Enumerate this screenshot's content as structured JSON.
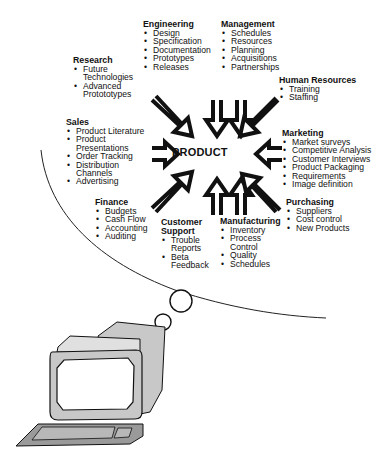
{
  "diagram": {
    "center_label": "PRODUCT",
    "groups": [
      {
        "id": "engineering",
        "title": "Engineering",
        "items": [
          "Design",
          "Specification",
          "Documentation",
          "Prototypes",
          "Releases"
        ]
      },
      {
        "id": "management",
        "title": "Management",
        "items": [
          "Schedules",
          "Resources",
          "Planning",
          "Acquisitions",
          "Partnerships"
        ]
      },
      {
        "id": "research",
        "title": "Research",
        "items": [
          "Future Technologies",
          "Advanced Protototypes"
        ]
      },
      {
        "id": "human-resources",
        "title": "Human Resources",
        "items": [
          "Training",
          "Staffing"
        ]
      },
      {
        "id": "sales",
        "title": "Sales",
        "items": [
          "Product Literature",
          "Product Presentations",
          "Order Tracking",
          "Distribution Channels",
          "Advertising"
        ]
      },
      {
        "id": "marketing",
        "title": "Marketing",
        "items": [
          "Market surveys",
          "Competitive Analysis",
          "Customer Interviews",
          "Product Packaging",
          "Requirements",
          "Image definition"
        ]
      },
      {
        "id": "finance",
        "title": "Finance",
        "items": [
          "Budgets",
          "Cash Flow",
          "Accounting",
          "Auditing"
        ]
      },
      {
        "id": "purchasing",
        "title": "Purchasing",
        "items": [
          "Suppliers",
          "Cost control",
          "New Products"
        ]
      },
      {
        "id": "customer-support",
        "title": "Customer Support",
        "items": [
          "Trouble Reports",
          "Beta Feedback"
        ]
      },
      {
        "id": "manufacturing",
        "title": "Manufacturing",
        "items": [
          "Inventory",
          "Process Control",
          "Quality",
          "Schedules"
        ]
      }
    ],
    "illustration": "computer-thought-bubble",
    "colors": {
      "ink": "#111111",
      "screen_gray": "#c8c8c8",
      "keyboard_gray": "#9a9a9a"
    }
  }
}
